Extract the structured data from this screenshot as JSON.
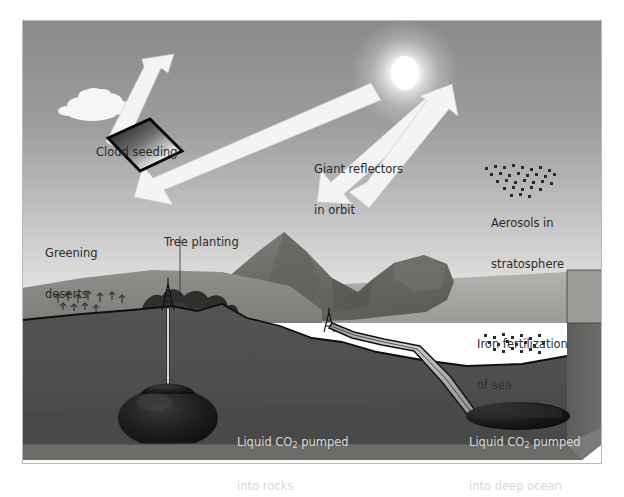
{
  "page": {
    "background_color": "#ffffff",
    "top_artifact_text": "a  b    c d    e f"
  },
  "figure": {
    "colors": {
      "sky_top": "#8d8d8d",
      "sky_horizon": "#ececec",
      "sea_surface": "#a5a5a2",
      "land_surface": "#8a8a88",
      "mountain": "#6f6f6d",
      "underground_rock": "#4e4e4e",
      "deep_block_side": "#565654",
      "co2_blob": "#1c1c1c",
      "arrow_white": "#f4f4f4",
      "reflector_dark": "#141414",
      "outline": "#111111",
      "label_text": "#2b2b2b",
      "label_text_deep": "#d9d9d9"
    },
    "labels": {
      "cloud_seeding": "Cloud seeding",
      "giant_reflectors_line1": "Giant reflectors",
      "giant_reflectors_line2": "in orbit",
      "aerosols_line1": "Aerosols in",
      "aerosols_line2": "stratosphere",
      "greening_deserts_line1": "Greening",
      "greening_deserts_line2": "deserts",
      "tree_planting": "Tree planting",
      "iron_fertilization_line1": "Iron fertilization",
      "iron_fertilization_line2": "of sea",
      "co2_rocks_line1_a": "Liquid CO",
      "co2_rocks_line1_sub": "2",
      "co2_rocks_line1_b": " pumped",
      "co2_rocks_line2": "into rocks",
      "co2_ocean_line1_a": "Liquid CO",
      "co2_ocean_line1_sub": "2",
      "co2_ocean_line1_b": " pumped",
      "co2_ocean_line2": "into deep ocean"
    },
    "elements": {
      "sun": "sun-glow",
      "cloud": "cumulus-cloud",
      "reflector_panel": "orbital-mirror-panel",
      "incoming_ray_arrow": "sunlight-incoming-arrow",
      "reflected_ray_arrow_left": "sunlight-reflected-arrow-left",
      "incoming_ray_arrow_right": "sunlight-incoming-arrow-right",
      "reflected_ray_arrow_right": "sunlight-reflected-arrow-right",
      "aerosol_dots": "stratospheric-aerosol-dots",
      "iron_dots": "iron-particle-dots",
      "desert_saplings": "desert-sapling-row",
      "tree_stand": "planted-forest",
      "mountain_range": "mountain-range",
      "sea_body": "sea-water",
      "derrick_land": "injection-wellhead-land",
      "derrick_coast": "injection-wellhead-coast",
      "well_bore": "vertical-well-bore",
      "co2_reservoir_rock": "co2-reservoir-in-rocks",
      "seafloor_pipeline": "seafloor-co2-pipeline",
      "co2_pool_ocean": "co2-pool-deep-ocean",
      "block_edge_right": "block-diagram-right-face",
      "block_edge_bottom": "block-diagram-bottom-face"
    }
  }
}
